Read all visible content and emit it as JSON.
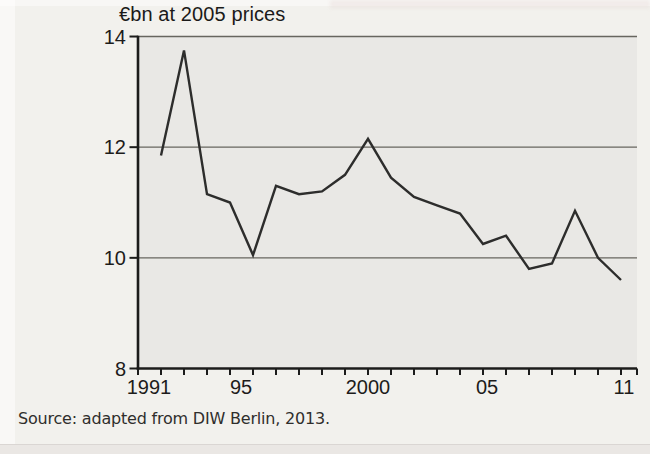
{
  "page": {
    "background": "#f2f1ed"
  },
  "chart_data": {
    "type": "line",
    "title": "€bn at 2005 prices",
    "x": [
      1991,
      1992,
      1993,
      1994,
      1995,
      1996,
      1997,
      1998,
      1999,
      2000,
      2001,
      2002,
      2003,
      2004,
      2005,
      2006,
      2007,
      2008,
      2009,
      2010,
      2011
    ],
    "values": [
      11.85,
      13.75,
      11.15,
      11.0,
      10.05,
      11.3,
      11.15,
      11.2,
      11.5,
      12.15,
      11.45,
      11.1,
      10.95,
      10.8,
      10.25,
      10.4,
      9.8,
      9.9,
      10.85,
      10.0,
      9.6
    ],
    "ylim": [
      8,
      14
    ],
    "yticks": [
      8,
      10,
      12,
      14
    ],
    "xlim": [
      1990,
      2011.7
    ],
    "xticks_minor": {
      "from": 1990,
      "to": 2011,
      "step": 1
    },
    "xtick_labels": [
      {
        "year": 1991,
        "label": "1991",
        "dx": -12
      },
      {
        "year": 1995,
        "label": "95",
        "dx": -12
      },
      {
        "year": 2000,
        "label": "2000",
        "dx": 0
      },
      {
        "year": 2005,
        "label": "05",
        "dx": 4
      },
      {
        "year": 2011,
        "label": "11",
        "dx": 3
      }
    ],
    "grid": "horizontal gridlines at y = 10, 12, 14; plot open on right side",
    "legend": "none",
    "line_color": "#2d2d2c",
    "plot_bg": "#e9e8e5",
    "axis_color": "#1c1c1b",
    "grid_color": "#67665f"
  },
  "source": {
    "text": "Source: adapted from DIW Berlin, 2013."
  }
}
